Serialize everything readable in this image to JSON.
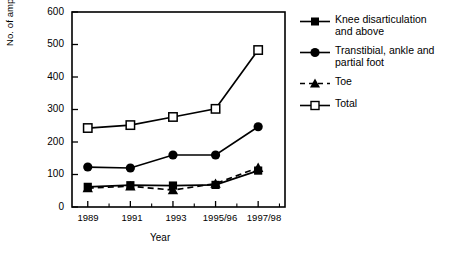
{
  "chart_data": {
    "type": "line",
    "title": "",
    "xlabel": "Year",
    "ylabel": "No. of amputations",
    "categories": [
      "1989",
      "1991",
      "1993",
      "1995/96",
      "1997/98"
    ],
    "ylim": [
      0,
      600
    ],
    "yticks": [
      0,
      100,
      200,
      300,
      400,
      500,
      600
    ],
    "ytick_labels": [
      "0",
      "100",
      "200",
      "300",
      "400",
      "500",
      "600"
    ],
    "grid": false,
    "legend_position": "right",
    "minor_ticks_x": true,
    "minor_ticks_y": false,
    "series": [
      {
        "name": "Knee disarticulation and above",
        "legend_label": "Knee disarticulation\nand above",
        "marker": "filled-square",
        "linestyle": "solid",
        "color": "#000000",
        "values": [
          62,
          67,
          66,
          68,
          112
        ]
      },
      {
        "name": "Transtibial, ankle and partial foot",
        "legend_label": "Transtibial, ankle and\npartial foot",
        "marker": "filled-circle",
        "linestyle": "solid",
        "color": "#000000",
        "values": [
          123,
          120,
          160,
          160,
          247
        ]
      },
      {
        "name": "Toe",
        "legend_label": "Toe",
        "marker": "filled-triangle",
        "linestyle": "dashed",
        "color": "#000000",
        "values": [
          58,
          64,
          52,
          72,
          121
        ]
      },
      {
        "name": "Total",
        "legend_label": "Total",
        "marker": "open-square",
        "linestyle": "solid",
        "color": "#000000",
        "values": [
          243,
          252,
          277,
          302,
          483
        ]
      }
    ]
  },
  "axes": {
    "frame_color": "#000000"
  }
}
